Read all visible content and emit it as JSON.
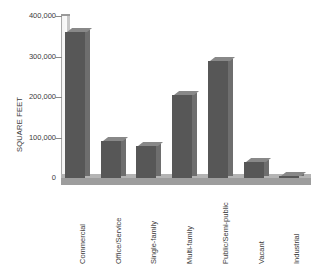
{
  "chart_data": {
    "type": "bar",
    "title": "",
    "xlabel": "",
    "ylabel": "SQUARE FEET",
    "categories": [
      "Commercial",
      "Office/Service",
      "Single-family",
      "Multi-family",
      "Public/Semi-public",
      "Vacant",
      "Industrial"
    ],
    "values": [
      360000,
      92000,
      78000,
      205000,
      290000,
      40000,
      6000
    ],
    "ylim": [
      0,
      400000
    ],
    "yticks": [
      0,
      100000,
      200000,
      300000,
      400000
    ],
    "ytick_labels": [
      "0",
      "100,000",
      "200,000",
      "300,000",
      "400,000"
    ],
    "grid": false,
    "legend": false,
    "bar_color": "#575757",
    "bar_side_color": "#6e6e6e",
    "bar_top_color": "#888888",
    "axis_color": "#9a9a9a",
    "floor_color": "#9d9d9d",
    "background": "#ffffff",
    "style": "3d-bar"
  }
}
